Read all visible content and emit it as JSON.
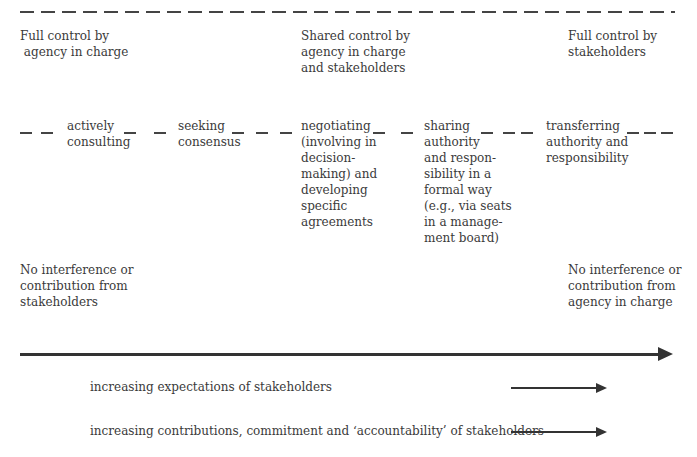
{
  "top_labels": {
    "left": "Full control by\n agency in charge",
    "center": "Shared control by\nagency in charge\nand stakeholders",
    "right": "Full control by\nstakeholders"
  },
  "stages": [
    {
      "id": "actively-consulting",
      "text": "actively\nconsulting"
    },
    {
      "id": "seeking-consensus",
      "text": "seeking\nconsensus"
    },
    {
      "id": "negotiating",
      "text": "negotiating\n(involving in\ndecision-\nmaking) and\ndeveloping\nspecific\nagreements"
    },
    {
      "id": "sharing-authority",
      "text": "sharing\nauthority\nand respon-\nsibility in a\nformal way\n(e.g., via seats\nin a manage-\nment board)"
    },
    {
      "id": "transferring-authority",
      "text": "transferring\nauthority and\nresponsibility"
    }
  ],
  "bottom_labels": {
    "left": "No interference or\ncontribution from\nstakeholders",
    "right": "No interference or\ncontribution from\nagency in charge"
  },
  "trends": [
    {
      "text": "increasing expectations of stakeholders"
    },
    {
      "text": "increasing contributions, commitment and ‘accountability’ of stakeholders"
    }
  ],
  "colors": {
    "text": "#3a3a3a",
    "lines": "#333333",
    "background": "#ffffff"
  }
}
